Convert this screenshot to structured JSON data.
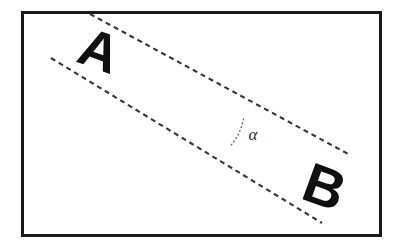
{
  "figure": {
    "type": "geometry-diagram",
    "background_color": "#ffffff",
    "frame": {
      "name": "outer-rectangle-border",
      "x": 21,
      "y": 11,
      "width": 361,
      "height": 226,
      "stroke_color": "#1a1a1a",
      "stroke_width": 3
    },
    "labels": {
      "letter_a": "A",
      "letter_b": "B",
      "angle_symbol": "α"
    },
    "letter_a_mark": {
      "name": "label-A",
      "text": "A",
      "x": 93,
      "y": 68,
      "font_size": 54,
      "rotation_deg": 20,
      "color": "#101010"
    },
    "letter_b_mark": {
      "name": "label-B",
      "text": "B",
      "x": 318,
      "y": 205,
      "font_size": 56,
      "rotation_deg": 20,
      "color": "#101010"
    },
    "angle_mark": {
      "name": "angle-alpha",
      "text": "α",
      "x": 253,
      "y": 140,
      "font_size": 17,
      "color": "#2a2a2a"
    },
    "lines": [
      {
        "name": "dashed-line-upper",
        "x1": 90,
        "y1": 14,
        "x2": 350,
        "y2": 155,
        "stroke_color": "#35353d",
        "stroke_width": 2,
        "dash_pattern": "5 4"
      },
      {
        "name": "dashed-line-lower",
        "x1": 51,
        "y1": 58,
        "x2": 322,
        "y2": 223,
        "stroke_color": "#35353d",
        "stroke_width": 2,
        "dash_pattern": "5 4"
      }
    ],
    "angle_arc": {
      "name": "angle-arc",
      "center_x": 188,
      "center_y": 113,
      "radius": 57,
      "stroke_color": "#55555d",
      "stroke_width": 1,
      "dash_pattern": "2 2",
      "path": "M 243 121 A 57 57 0 0 1 231 147"
    }
  }
}
